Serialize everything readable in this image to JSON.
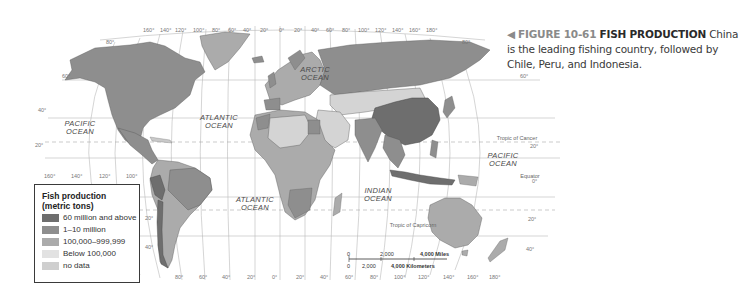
{
  "figure": {
    "arrow": "◀",
    "number": "FIGURE 10-61",
    "title": "FISH PRODUCTION",
    "caption": "China is the leading fishing country, followed by Chile, Peru, and Indonesia."
  },
  "legend": {
    "title_line1": "Fish production",
    "title_line2": "(metric tons)",
    "items": [
      {
        "label": "60 million and above",
        "color": "#6e6e6e"
      },
      {
        "label": "1–10 million",
        "color": "#8e8e8e"
      },
      {
        "label": "100,000–999,999",
        "color": "#ababab"
      },
      {
        "label": "Below 100,000",
        "color": "#d4d4d4"
      },
      {
        "label": "no data",
        "color": "#c9c9c9"
      }
    ]
  },
  "oceans": {
    "arctic_1": "ARCTIC",
    "arctic_2": "OCEAN",
    "pacific_w_1": "PACIFIC",
    "pacific_w_2": "OCEAN",
    "atlantic_n_1": "ATLANTIC",
    "atlantic_n_2": "OCEAN",
    "atlantic_s_1": "ATLANTIC",
    "atlantic_s_2": "OCEAN",
    "indian_1": "INDIAN",
    "indian_2": "OCEAN",
    "pacific_e_1": "PACIFIC",
    "pacific_e_2": "OCEAN"
  },
  "reference_lines": {
    "tropic_cancer": "Tropic of Cancer",
    "equator": "Equator",
    "tropic_capricorn": "Tropic of Capricorn"
  },
  "top_longitudes": [
    "160°",
    "140°",
    "120°",
    "100°",
    "80°",
    "60°",
    "40°",
    "20°",
    "0°",
    "20°",
    "40°",
    "60°",
    "80°",
    "100°",
    "120°",
    "140°",
    "160°",
    "180°"
  ],
  "bottom_longitudes_left": [
    "160°",
    "140°",
    "120°",
    "100°"
  ],
  "bottom_longitudes": [
    "80°",
    "60°",
    "40°",
    "20°",
    "0°",
    "20°",
    "40°",
    "60°",
    "80°",
    "100°",
    "120°",
    "140°",
    "160°",
    "180°"
  ],
  "latitudes": {
    "lat80": "80°",
    "lat60": "60°",
    "lat40": "40°",
    "lat20": "20°",
    "lat0": "0°",
    "lat20s": "20°",
    "lat40s": "40°"
  },
  "scale": {
    "miles_0": "0",
    "miles_mid": "2,000",
    "miles_end": "4,000 Miles",
    "km_0": "0",
    "km_mid": "2,000",
    "km_end": "4,000 Kilometers"
  }
}
